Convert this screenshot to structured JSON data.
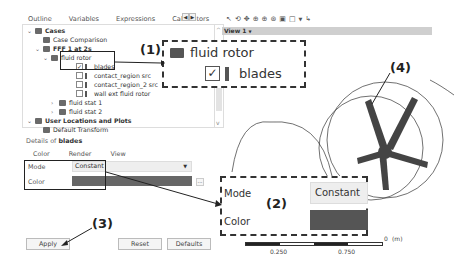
{
  "left_panel": {
    "tabs": [
      "Outline",
      "Variables",
      "Expressions",
      "Calculators"
    ],
    "tab_scroll": {
      "left": "◀",
      "right": "▶"
    },
    "tree": [
      {
        "label": "Cases",
        "level": 0,
        "bold": true,
        "expanded": true,
        "icon": "cases-icon"
      },
      {
        "label": "Case Comparison",
        "level": 1,
        "icon": "case-comparison-icon"
      },
      {
        "label": "FFF 1 at 2s",
        "level": 1,
        "bold": true,
        "expanded": true,
        "icon": "case-icon"
      },
      {
        "label": "fluid rotor",
        "level": 2,
        "expanded": true,
        "icon": "domain-icon"
      },
      {
        "label": "blades",
        "level": 3,
        "checked": true,
        "icon": "boundary-icon"
      },
      {
        "label": "contact_region src",
        "level": 3,
        "checked": false,
        "icon": "boundary-icon"
      },
      {
        "label": "contact_region_2 src",
        "level": 3,
        "checked": false,
        "icon": "boundary-icon"
      },
      {
        "label": "wall ext fluid rotor",
        "level": 3,
        "checked": false,
        "icon": "boundary-icon"
      },
      {
        "label": "fluid stat 1",
        "level": 2,
        "expanded": false,
        "icon": "domain-icon"
      },
      {
        "label": "fluid stat 2",
        "level": 2,
        "expanded": false,
        "icon": "domain-icon"
      },
      {
        "label": "User Locations and Plots",
        "level": 0,
        "bold": true,
        "expanded": true,
        "icon": "user-locations-icon"
      },
      {
        "label": "Default Transform",
        "level": 1,
        "icon": "transform-icon"
      }
    ],
    "details": {
      "title_prefix": "Details of ",
      "title_object": "blades",
      "tabs": [
        "Color",
        "Render",
        "View"
      ],
      "mode_label": "Mode",
      "mode_value": "Constant",
      "color_label": "Color",
      "color_value": "#666666",
      "dots_label": "..."
    },
    "buttons": {
      "apply": "Apply",
      "reset": "Reset",
      "defaults": "Defaults"
    }
  },
  "viewer": {
    "toolbar_icons": [
      "select-icon",
      "rotate-icon",
      "pan-icon",
      "zoom-icon",
      "zoom-box-icon",
      "zoom-fit-icon",
      "fit-view-icon",
      "viewport-layout-icon",
      "dropdown-icon",
      "probe-icon"
    ],
    "view_label": "View 1",
    "view_caret": "▼",
    "scale": {
      "labels": [
        "0.250",
        "0.750"
      ],
      "zero": "0",
      "unit": "(m)"
    }
  },
  "callouts": {
    "c1": {
      "label": "(1)",
      "parent": "fluid rotor",
      "child": "blades"
    },
    "c2": {
      "label": "(2)",
      "mode_label": "Mode",
      "mode_value": "Constant",
      "color_label": "Color"
    },
    "c3": {
      "label": "(3)"
    },
    "c4": {
      "label": "(4)"
    }
  },
  "colors": {
    "blade": "#444444",
    "swatch": "#666666",
    "viewbar": "#cfcfcf"
  }
}
